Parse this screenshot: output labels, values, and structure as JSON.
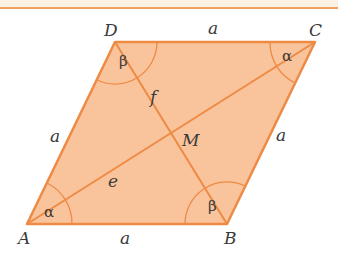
{
  "diagram": {
    "shape": "rhombus",
    "colors": {
      "fill": "#f9c49c",
      "stroke": "#ee8a44",
      "text": "#3a3a3a",
      "header_band": "#fdf1e4"
    },
    "vertices": {
      "A": {
        "label": "A",
        "x": 27,
        "y": 224
      },
      "B": {
        "label": "B",
        "x": 227,
        "y": 224
      },
      "C": {
        "label": "C",
        "x": 315,
        "y": 42
      },
      "D": {
        "label": "D",
        "x": 115,
        "y": 42
      }
    },
    "sides": {
      "AB": "a",
      "BC": "a",
      "CD": "a",
      "DA": "a"
    },
    "diagonals": {
      "AC": "e",
      "BD": "f"
    },
    "center": "M",
    "angles": {
      "A": "α",
      "B": "β",
      "C": "α",
      "D": "β"
    }
  }
}
